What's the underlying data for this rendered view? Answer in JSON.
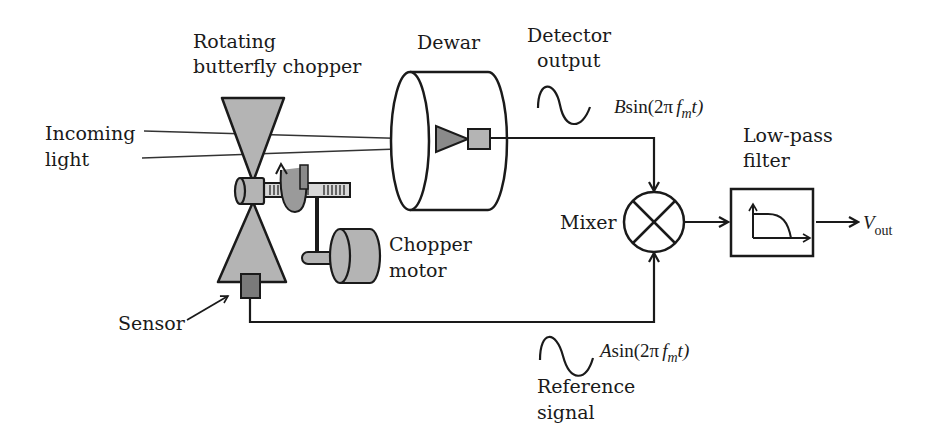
{
  "diagram": {
    "type": "lock-in amplifier optical chopper setup",
    "labels": {
      "chopper": [
        "Rotating",
        "butterfly chopper"
      ],
      "incoming_light": [
        "Incoming",
        "light"
      ],
      "dewar": "Dewar",
      "detector_output": [
        "Detector",
        "output"
      ],
      "detector_signal": {
        "coef": "B",
        "func": "sin(2π",
        "f": "f",
        "sub": "m",
        "t": "t)"
      },
      "low_pass_filter": [
        "Low-pass",
        "filter"
      ],
      "mixer": "Mixer",
      "vout": {
        "main": "V",
        "sub": "out"
      },
      "chopper_motor": [
        "Chopper",
        "motor"
      ],
      "sensor": "Sensor",
      "reference_signal_eq": {
        "coef": "A",
        "func": "sin(2π",
        "f": "f",
        "sub": "m",
        "t": "t)"
      },
      "reference_signal": [
        "Reference",
        "signal"
      ]
    },
    "colors": {
      "line": "#1a1a1a",
      "gray_fill": "#b4b4b4",
      "dark_fill": "#7a7a7a",
      "background": "#ffffff"
    }
  }
}
